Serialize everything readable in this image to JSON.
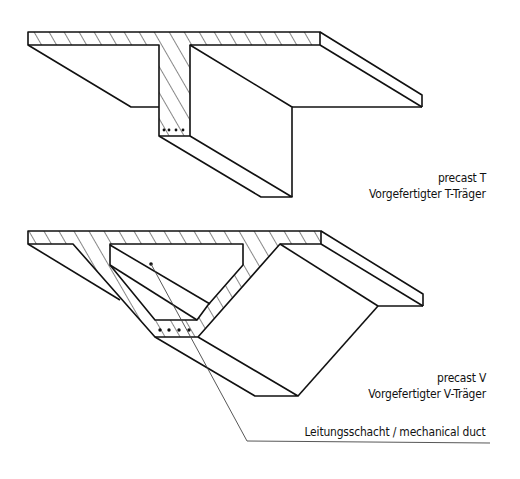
{
  "colors": {
    "ink": "#111111",
    "leader": "#444444",
    "background": "#ffffff"
  },
  "figures": [
    {
      "id": "precast-t",
      "labels": {
        "en": "precast T",
        "de": "Vorgefertigter T-Träger"
      }
    },
    {
      "id": "precast-v",
      "labels": {
        "en": "precast V",
        "de": "Vorgefertigter V-Träger"
      },
      "callout": "Leitungsschacht / mechanical duct"
    }
  ]
}
